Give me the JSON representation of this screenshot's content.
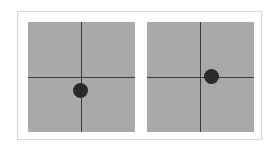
{
  "figure": {
    "frame_color": "#d6d6d6",
    "panel_color": "#a9a9a9",
    "axis_color": "#3c3c3c",
    "dot_color": "#2a2a2a",
    "panels": [
      {
        "id": "left",
        "description": "Crosshair with dot below center",
        "dot_offset": {
          "x": -0.02,
          "y": 0.26
        }
      },
      {
        "id": "right",
        "description": "Crosshair with dot right of center on horizontal axis",
        "dot_offset": {
          "x": 0.2,
          "y": 0.0
        }
      }
    ]
  }
}
